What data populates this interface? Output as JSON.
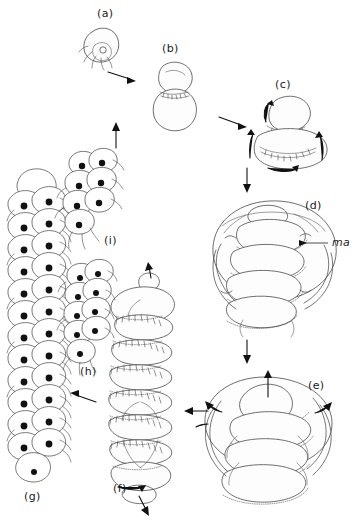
{
  "figure": {
    "type": "scientific-line-drawing",
    "title": "",
    "caption": "",
    "background_color": "#ffffff",
    "ink_color": "#3f3f3f",
    "panels": [
      {
        "id": "a",
        "label": "(a)",
        "label_x": 97,
        "label_y": 13,
        "stage": "single rounded cell with short cilia",
        "center_x": 103,
        "center_y": 45
      },
      {
        "id": "b",
        "label": "(b)",
        "label_x": 162,
        "label_y": 48,
        "stage": "two-lobed dividing stage with constriction furrow",
        "center_x": 174,
        "center_y": 93
      },
      {
        "id": "c",
        "label": "(c)",
        "label_x": 275,
        "label_y": 84,
        "stage": "bilobed stage with ciliary bands and rotation arrows",
        "center_x": 288,
        "center_y": 130
      },
      {
        "id": "d",
        "label": "(d)",
        "label_x": 305,
        "label_y": 205,
        "stage": "compact multi-tiered embryo enclosed in membrane, macromere labelled",
        "center_x": 272,
        "center_y": 248
      },
      {
        "id": "e",
        "label": "(e)",
        "label_x": 308,
        "label_y": 385,
        "stage": "expanded tiered embryo with everting ciliated rings",
        "center_x": 268,
        "center_y": 425
      },
      {
        "id": "f",
        "label": "(f)",
        "label_x": 113,
        "label_y": 487,
        "stage": "elongate segmented ciliated larva with apical cap",
        "center_x": 145,
        "center_y": 380
      },
      {
        "id": "g",
        "label": "(g)",
        "label_x": 24,
        "label_y": 495,
        "stage": "long chain of nucleated ciliated cells",
        "center_x": 34,
        "center_y": 325
      },
      {
        "id": "h",
        "label": "(h)",
        "label_x": 80,
        "label_y": 371,
        "stage": "short cluster of nucleated ciliated cells",
        "center_x": 86,
        "center_y": 312
      },
      {
        "id": "i",
        "label": "(i)",
        "label_x": 104,
        "label_y": 240,
        "stage": "compact rosette of nucleated ciliated cells",
        "center_x": 88,
        "center_y": 192
      }
    ],
    "annotations": [
      {
        "id": "ma",
        "text": "ma",
        "italic": true,
        "x": 332,
        "y": 238,
        "leader_from_x": 328,
        "leader_from_y": 243,
        "leader_to_x": 303,
        "leader_to_y": 243,
        "meaning": "label pointing to a structure in panel d"
      }
    ],
    "flow_arrows": [
      {
        "from": "a",
        "to": "b",
        "direction": "right-down",
        "x1": 108,
        "y1": 72,
        "x2": 134,
        "y2": 80
      },
      {
        "from": "b",
        "to": "c",
        "direction": "right-down",
        "x1": 219,
        "y1": 117,
        "x2": 245,
        "y2": 126
      },
      {
        "from": "c",
        "to": "d",
        "direction": "down",
        "x1": 247,
        "y1": 168,
        "x2": 247,
        "y2": 192
      },
      {
        "from": "d",
        "to": "e",
        "direction": "down",
        "x1": 247,
        "y1": 338,
        "x2": 247,
        "y2": 362
      },
      {
        "from": "e",
        "to": "f",
        "direction": "left",
        "x1": 208,
        "y1": 411,
        "x2": 184,
        "y2": 411
      },
      {
        "from": "f",
        "to": "g",
        "direction": "left-up",
        "x1": 96,
        "y1": 402,
        "x2": 70,
        "y2": 394
      },
      {
        "from": "g_h",
        "to": "i",
        "direction": "up",
        "x1": 116,
        "y1": 148,
        "x2": 116,
        "y2": 124
      }
    ],
    "motion_arrows_note": "short solid arrowheads on panels c, e and f indicate ciliary beat and body rotation directions"
  }
}
